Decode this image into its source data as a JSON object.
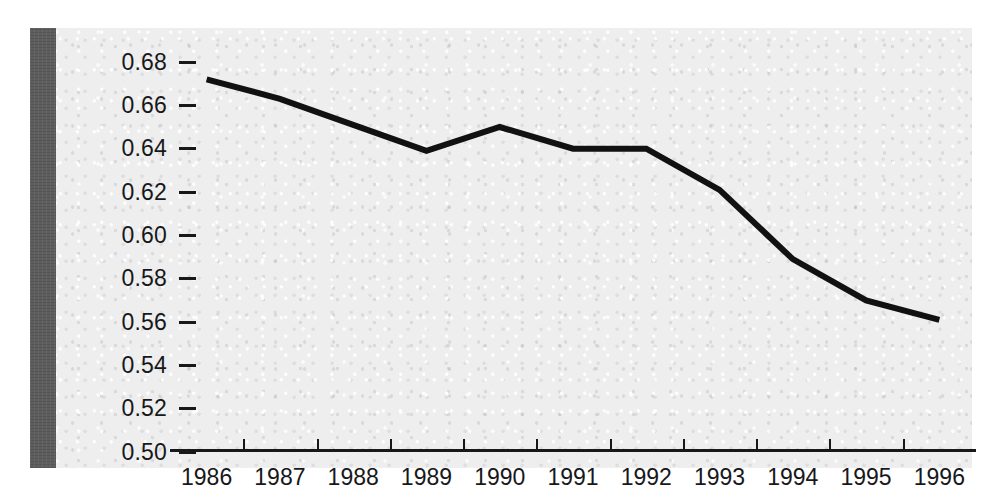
{
  "figure": {
    "background_color": "#eeeeee",
    "page_color": "#ffffff",
    "gutter_bar_color": "#5e5e5e",
    "axis_color": "#17181a",
    "line_color": "#111111"
  },
  "chart_data": {
    "type": "line",
    "title": "",
    "subtitle": "",
    "xlabel": "",
    "ylabel": "",
    "categories": [
      "1986",
      "1987",
      "1988",
      "1989",
      "1990",
      "1991",
      "1992",
      "1993",
      "1994",
      "1995",
      "1996"
    ],
    "x": [
      1986,
      1987,
      1988,
      1989,
      1990,
      1991,
      1992,
      1993,
      1994,
      1995,
      1996
    ],
    "values": [
      0.672,
      0.663,
      0.651,
      0.639,
      0.65,
      0.64,
      0.64,
      0.621,
      0.589,
      0.57,
      0.561
    ],
    "series": [
      {
        "name": "",
        "values": [
          0.672,
          0.663,
          0.651,
          0.639,
          0.65,
          0.64,
          0.64,
          0.621,
          0.589,
          0.57,
          0.561
        ]
      }
    ],
    "ylim": [
      0.5,
      0.68
    ],
    "xlim": [
      1986,
      1996
    ],
    "ytick_labels": [
      "0.68",
      "0.66",
      "0.64",
      "0.62",
      "0.60",
      "0.58",
      "0.56",
      "0.54",
      "0.52",
      "0.50"
    ],
    "ytick_values": [
      0.68,
      0.66,
      0.64,
      0.62,
      0.6,
      0.58,
      0.56,
      0.54,
      0.52,
      0.5
    ],
    "ytick_step": 0.02,
    "xtick_labels": [
      "1986",
      "1987",
      "1988",
      "1989",
      "1990",
      "1991",
      "1992",
      "1993",
      "1994",
      "1995",
      "1996"
    ],
    "grid": false,
    "legend": false,
    "legend_position": "none",
    "annotations": [],
    "line_width_px": 6,
    "marker": "none"
  }
}
